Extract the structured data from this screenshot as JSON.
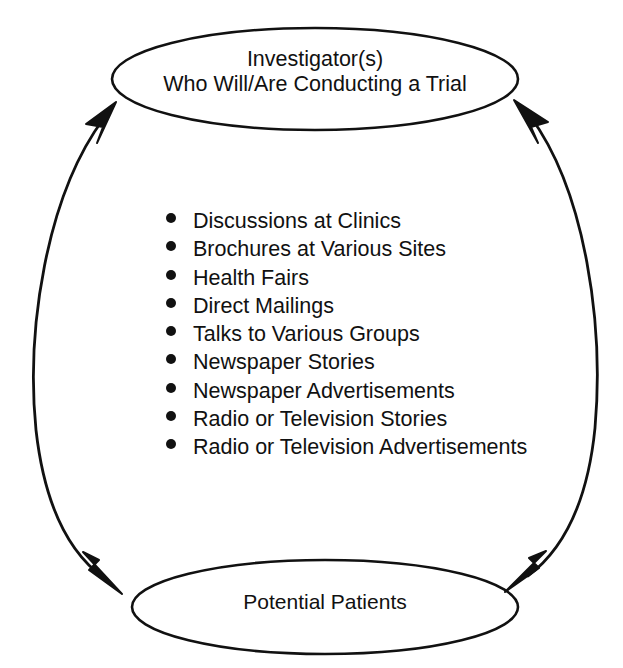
{
  "diagram": {
    "top_node": {
      "line1": "Investigator(s)",
      "line2": "Who Will/Are Conducting a Trial"
    },
    "bottom_node": {
      "line1": "Potential Patients"
    },
    "methods": [
      {
        "label": "Discussions at Clinics"
      },
      {
        "label": "Brochures at Various Sites"
      },
      {
        "label": "Health Fairs"
      },
      {
        "label": "Direct Mailings"
      },
      {
        "label": "Talks to Various Groups"
      },
      {
        "label": "Newspaper Stories"
      },
      {
        "label": "Newspaper Advertisements"
      },
      {
        "label": "Radio or Television Stories"
      },
      {
        "label": "Radio or Television Advertisements"
      }
    ],
    "connectors": [
      {
        "name": "left-arc",
        "direction": "bidirectional"
      },
      {
        "name": "right-arc",
        "direction": "bidirectional"
      }
    ],
    "colors": {
      "stroke": "#111111",
      "background": "#ffffff",
      "text": "#111111"
    }
  }
}
